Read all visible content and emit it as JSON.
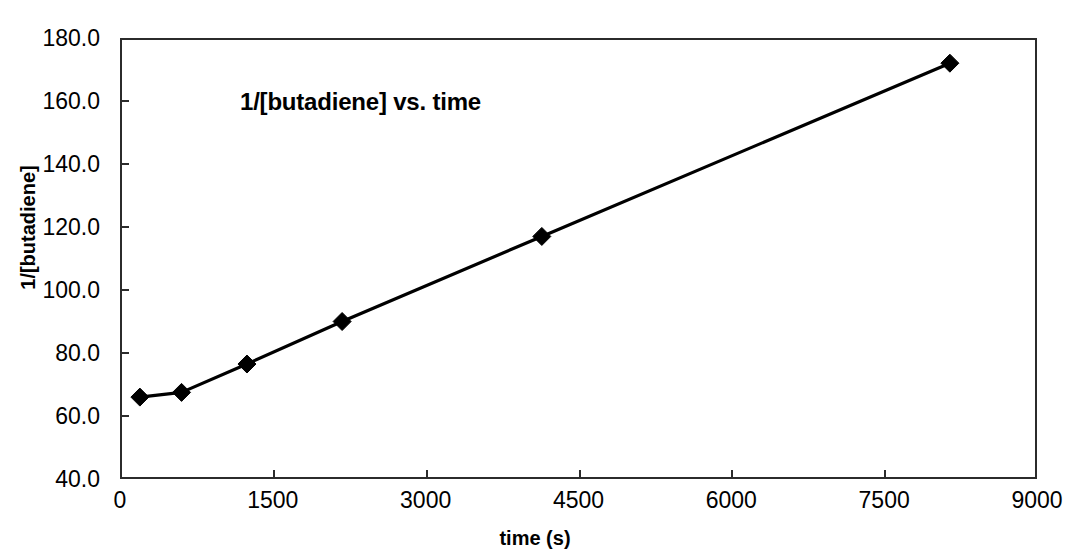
{
  "chart_data": {
    "type": "line",
    "title": "1/[butadiene] vs. time",
    "xlabel": "time (s)",
    "ylabel": "1/[butadiene]",
    "xlim": [
      0,
      9000
    ],
    "ylim": [
      40.0,
      180.0
    ],
    "grid": false,
    "legend": null,
    "legend_position": "none",
    "marker": "diamond",
    "marker_color": "#000000",
    "line_color": "#000000",
    "xticks": [
      0,
      1500,
      3000,
      4500,
      6000,
      7500,
      9000
    ],
    "xtick_labels": [
      "0",
      "1500",
      "3000",
      "4500",
      "6000",
      "7500",
      "9000"
    ],
    "yticks": [
      40.0,
      60.0,
      80.0,
      100.0,
      120.0,
      140.0,
      160.0,
      180.0
    ],
    "ytick_labels": [
      "40.0",
      "60.0",
      "80.0",
      "100.0",
      "120.0",
      "140.0",
      "160.0",
      "180.0"
    ],
    "x": [
      195,
      604,
      1246,
      2180,
      4140,
      8145
    ],
    "values": [
      66.0,
      67.5,
      76.5,
      90.0,
      117.0,
      172.0
    ],
    "points": [
      {
        "x": 195,
        "y": 66.0
      },
      {
        "x": 604,
        "y": 67.5
      },
      {
        "x": 1246,
        "y": 76.5
      },
      {
        "x": 2180,
        "y": 90.0
      },
      {
        "x": 4140,
        "y": 117.0
      },
      {
        "x": 8145,
        "y": 172.0
      }
    ]
  },
  "colors": {
    "axis": "#2b2b2b",
    "series": "#000000",
    "background": "#ffffff"
  }
}
